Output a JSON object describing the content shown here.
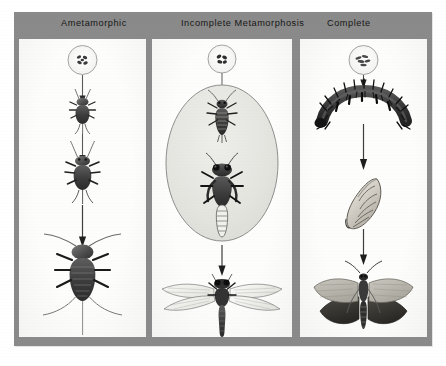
{
  "figure": {
    "kind": "scientific-illustration",
    "background_color": "#ffffff",
    "plate_color": "#8a8a8a",
    "panel_color": "#fdfdfb",
    "ink_color": "#2a2a2a"
  },
  "header": {
    "columns": [
      {
        "id": "ametamorphic",
        "label": "Ametamorphic"
      },
      {
        "id": "incomplete",
        "label": "Incomplete  Metamorphosis"
      },
      {
        "id": "complete",
        "label": "Complete"
      }
    ]
  },
  "panels": [
    {
      "id": "panel-ametamorphic",
      "title": "Ametamorphic",
      "stages": [
        {
          "id": "egg",
          "label": "egg cluster in circle",
          "shape": "circle-with-eggs"
        },
        {
          "id": "young-nymph",
          "label": "young silverfish",
          "shape": "silverfish-small"
        },
        {
          "id": "older-nymph",
          "label": "older silverfish",
          "shape": "silverfish-medium"
        },
        {
          "id": "adult",
          "label": "adult silverfish",
          "shape": "silverfish-large"
        }
      ],
      "arrows": 3
    },
    {
      "id": "panel-incomplete",
      "title": "Incomplete  Metamorphosis",
      "stages": [
        {
          "id": "egg",
          "label": "egg cluster in circle",
          "shape": "circle-with-eggs"
        },
        {
          "id": "naiad-early",
          "label": "early dragonfly naiad",
          "shape": "naiad-small"
        },
        {
          "id": "naiad-late",
          "label": "late dragonfly naiad",
          "shape": "naiad-large"
        },
        {
          "id": "adult",
          "label": "adult dragonfly",
          "shape": "dragonfly"
        }
      ],
      "oval_highlight": true,
      "arrows": 2
    },
    {
      "id": "panel-complete",
      "title": "Complete",
      "stages": [
        {
          "id": "egg",
          "label": "egg cluster in circle",
          "shape": "circle-with-eggs"
        },
        {
          "id": "larva",
          "label": "caterpillar larva",
          "shape": "caterpillar"
        },
        {
          "id": "pupa",
          "label": "pupa / chrysalis",
          "shape": "pupa"
        },
        {
          "id": "adult",
          "label": "adult moth",
          "shape": "moth"
        }
      ],
      "arrows": 3
    }
  ]
}
